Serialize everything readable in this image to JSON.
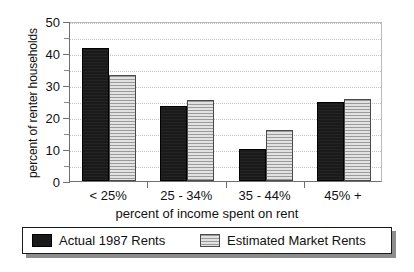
{
  "chart_data": {
    "type": "bar",
    "title": "",
    "subtitle": "",
    "xlabel": "percent of income spent on rent",
    "ylabel": "percent of renter households",
    "categories": [
      "< 25%",
      "25 - 34%",
      "35 - 44%",
      "45% +"
    ],
    "series": [
      {
        "name": "Actual 1987 Rents",
        "color": "#1a1a1a",
        "values": [
          41.5,
          23.5,
          9.9,
          24.8
        ]
      },
      {
        "name": "Estimated Market Rents",
        "color": "#d2d2d2",
        "values": [
          33.0,
          25.3,
          15.8,
          25.5
        ]
      }
    ],
    "ylim": [
      0,
      50
    ],
    "yticks": [
      0,
      10,
      20,
      30,
      40,
      50
    ],
    "ytick_labels": [
      "0",
      "10",
      "20",
      "30",
      "40",
      "50"
    ],
    "yminor_ticks": [
      5,
      15,
      25,
      35,
      45
    ],
    "grid": true,
    "grid_axis": "y",
    "legend_position": "bottom"
  },
  "legend": {
    "entries": [
      {
        "label": "Actual 1987 Rents",
        "swatch": "dark-solid-swatch"
      },
      {
        "label": "Estimated Market Rents",
        "swatch": "light-hatched-swatch"
      }
    ]
  }
}
